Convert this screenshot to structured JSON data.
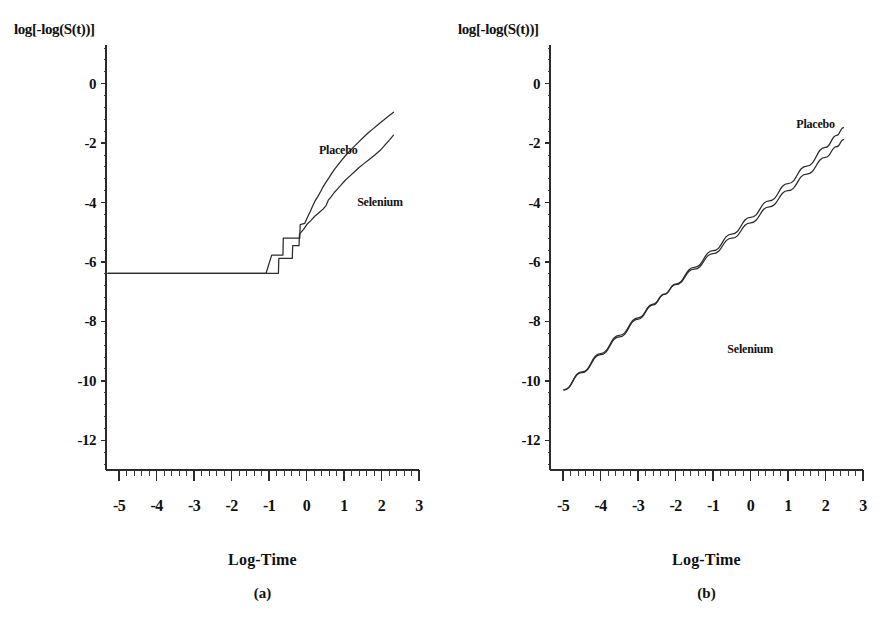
{
  "figure": {
    "background": "#ffffff",
    "ink": "#2b2b2b",
    "width": 887,
    "height": 638
  },
  "chart_data": [
    {
      "type": "line",
      "panel_id": "a",
      "caption": "(a)",
      "title": "",
      "xlabel": "Log-Time",
      "ylabel": "log[-log(S(t))]",
      "xlim": [
        -5.35,
        3.0
      ],
      "ylim": [
        -13.0,
        0.9
      ],
      "xticks": [
        -5,
        -4,
        -3,
        -2,
        -1,
        0,
        1,
        2,
        3
      ],
      "xtick_labels": [
        "-5",
        "-4",
        "-3",
        "-2",
        "-1",
        "0",
        "1",
        "2",
        "3"
      ],
      "yticks": [
        0,
        -2,
        -4,
        -6,
        -8,
        -10,
        -12
      ],
      "ytick_labels": [
        "0",
        "-2",
        "-4",
        "-6",
        "-8",
        "-10",
        "-12"
      ],
      "minor_ticks_per_interval": 4,
      "grid": false,
      "legend_position": "inline-annotation",
      "annotations": [
        {
          "text": "Placebo",
          "x": 0.33,
          "y": -2.35
        },
        {
          "text": "Selenium",
          "x": 1.35,
          "y": -4.12
        }
      ],
      "series": [
        {
          "name": "Placebo",
          "style": "step",
          "points": [
            [
              -5.3,
              -6.38
            ],
            [
              -1.08,
              -6.38
            ],
            [
              -0.93,
              -5.77
            ],
            [
              -0.63,
              -5.77
            ],
            [
              -0.62,
              -5.2
            ],
            [
              -0.18,
              -5.2
            ],
            [
              -0.17,
              -4.74
            ],
            [
              -0.05,
              -4.7
            ],
            [
              0.04,
              -4.45
            ],
            [
              0.1,
              -4.3
            ],
            [
              0.16,
              -4.12
            ],
            [
              0.22,
              -3.96
            ],
            [
              0.3,
              -3.8
            ],
            [
              0.38,
              -3.62
            ],
            [
              0.44,
              -3.47
            ],
            [
              0.52,
              -3.31
            ],
            [
              0.6,
              -3.16
            ],
            [
              0.68,
              -3.0
            ],
            [
              0.76,
              -2.86
            ],
            [
              0.86,
              -2.7
            ],
            [
              0.96,
              -2.54
            ],
            [
              1.06,
              -2.39
            ],
            [
              1.16,
              -2.25
            ],
            [
              1.28,
              -2.1
            ],
            [
              1.4,
              -1.95
            ],
            [
              1.52,
              -1.8
            ],
            [
              1.64,
              -1.66
            ],
            [
              1.78,
              -1.51
            ],
            [
              1.92,
              -1.36
            ],
            [
              2.06,
              -1.22
            ],
            [
              2.2,
              -1.08
            ],
            [
              2.32,
              -0.96
            ]
          ]
        },
        {
          "name": "Selenium",
          "style": "step",
          "points": [
            [
              -5.3,
              -6.38
            ],
            [
              -0.75,
              -6.38
            ],
            [
              -0.74,
              -5.88
            ],
            [
              -0.38,
              -5.88
            ],
            [
              -0.37,
              -5.45
            ],
            [
              -0.2,
              -5.45
            ],
            [
              -0.19,
              -5.06
            ],
            [
              -0.08,
              -4.9
            ],
            [
              0.02,
              -4.72
            ],
            [
              0.12,
              -4.6
            ],
            [
              0.22,
              -4.46
            ],
            [
              0.33,
              -4.34
            ],
            [
              0.44,
              -4.22
            ],
            [
              0.52,
              -4.1
            ],
            [
              0.58,
              -3.92
            ],
            [
              0.66,
              -3.8
            ],
            [
              0.74,
              -3.66
            ],
            [
              0.84,
              -3.52
            ],
            [
              0.94,
              -3.38
            ],
            [
              1.04,
              -3.24
            ],
            [
              1.16,
              -3.1
            ],
            [
              1.28,
              -2.96
            ],
            [
              1.4,
              -2.82
            ],
            [
              1.54,
              -2.68
            ],
            [
              1.68,
              -2.54
            ],
            [
              1.82,
              -2.4
            ],
            [
              1.96,
              -2.25
            ],
            [
              2.1,
              -2.05
            ],
            [
              2.22,
              -1.88
            ],
            [
              2.32,
              -1.73
            ]
          ]
        }
      ]
    },
    {
      "type": "line",
      "panel_id": "b",
      "caption": "(b)",
      "title": "",
      "xlabel": "Log-Time",
      "ylabel": "log[-log(S(t))]",
      "xlim": [
        -5.35,
        3.0
      ],
      "ylim": [
        -13.0,
        0.9
      ],
      "xticks": [
        -5,
        -4,
        -3,
        -2,
        -1,
        0,
        1,
        2,
        3
      ],
      "xtick_labels": [
        "-5",
        "-4",
        "-3",
        "-2",
        "-1",
        "0",
        "1",
        "2",
        "3"
      ],
      "yticks": [
        0,
        -2,
        -4,
        -6,
        -8,
        -10,
        -12
      ],
      "ytick_labels": [
        "0",
        "-2",
        "-4",
        "-6",
        "-8",
        "-10",
        "-12"
      ],
      "minor_ticks_per_interval": 4,
      "grid": false,
      "legend_position": "inline-annotation",
      "annotations": [
        {
          "text": "Placebo",
          "x": 1.22,
          "y": -1.5
        },
        {
          "text": "Selenium",
          "x": -0.62,
          "y": -9.05
        }
      ],
      "series": [
        {
          "name": "Placebo",
          "style": "smooth",
          "points": [
            [
              -4.98,
              -10.3
            ],
            [
              -4.5,
              -9.7
            ],
            [
              -4.0,
              -9.08
            ],
            [
              -3.5,
              -8.47
            ],
            [
              -3.0,
              -7.88
            ],
            [
              -2.6,
              -7.42
            ],
            [
              -2.3,
              -7.08
            ],
            [
              -2.0,
              -6.74
            ],
            [
              -1.5,
              -6.18
            ],
            [
              -1.0,
              -5.62
            ],
            [
              -0.5,
              -5.06
            ],
            [
              0.0,
              -4.5
            ],
            [
              0.5,
              -3.94
            ],
            [
              1.0,
              -3.36
            ],
            [
              1.5,
              -2.77
            ],
            [
              2.0,
              -2.14
            ],
            [
              2.3,
              -1.74
            ],
            [
              2.48,
              -1.48
            ]
          ]
        },
        {
          "name": "Selenium",
          "style": "smooth",
          "points": [
            [
              -4.98,
              -10.3
            ],
            [
              -4.5,
              -9.72
            ],
            [
              -4.0,
              -9.12
            ],
            [
              -3.5,
              -8.52
            ],
            [
              -3.0,
              -7.92
            ],
            [
              -2.6,
              -7.44
            ],
            [
              -2.3,
              -7.09
            ],
            [
              -2.0,
              -6.76
            ],
            [
              -1.5,
              -6.24
            ],
            [
              -1.0,
              -5.72
            ],
            [
              -0.5,
              -5.2
            ],
            [
              0.0,
              -4.68
            ],
            [
              0.5,
              -4.14
            ],
            [
              1.0,
              -3.6
            ],
            [
              1.5,
              -3.04
            ],
            [
              2.0,
              -2.48
            ],
            [
              2.3,
              -2.12
            ],
            [
              2.48,
              -1.88
            ]
          ]
        }
      ]
    }
  ]
}
